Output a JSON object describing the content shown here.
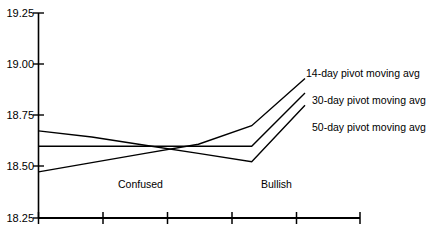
{
  "chart_data": {
    "type": "line",
    "title": "",
    "subtitle": "",
    "xlabel": "",
    "ylabel": "",
    "ylim": [
      18.25,
      19.25
    ],
    "ytick_labels": [
      "19.25",
      "19.00",
      "18.75",
      "18.50",
      "18.25"
    ],
    "ytick_values": [
      19.25,
      19.0,
      18.75,
      18.5,
      18.25
    ],
    "xtick_labels": [
      "",
      "",
      "",
      "",
      "",
      ""
    ],
    "xtick_count": 6,
    "grid": false,
    "legend_position": "right-inline",
    "line_color": "#000000",
    "background_color": "#ffffff",
    "axis_color": "#000000",
    "series": [
      {
        "name": "14-day pivot moving avg",
        "x": [
          0,
          1,
          2,
          3,
          4,
          5
        ],
        "values": [
          18.475,
          18.52,
          18.565,
          18.61,
          18.7,
          18.93
        ]
      },
      {
        "name": "30-day pivot moving avg",
        "x": [
          0,
          1,
          2,
          3,
          4,
          5
        ],
        "values": [
          18.6,
          18.6,
          18.6,
          18.6,
          18.6,
          18.86
        ]
      },
      {
        "name": "50-day pivot moving avg",
        "x": [
          0,
          1,
          2,
          3,
          4,
          5
        ],
        "values": [
          18.675,
          18.645,
          18.605,
          18.565,
          18.525,
          18.8
        ]
      }
    ],
    "annotations": [
      {
        "text": "Confused",
        "x": 1.55,
        "y": 18.4
      },
      {
        "text": "Bullish",
        "x": 3.55,
        "y": 18.4
      }
    ],
    "series_labels": [
      {
        "text": "14-day pivot moving avg",
        "series": "14-day pivot moving avg"
      },
      {
        "text": "30-day pivot moving avg",
        "series": "30-day pivot moving avg"
      },
      {
        "text": "50-day pivot moving avg",
        "series": "50-day pivot moving avg"
      }
    ]
  },
  "axis": {
    "y_labels": {
      "t0": "19.25",
      "t1": "19.00",
      "t2": "18.75",
      "t3": "18.50",
      "t4": "18.25"
    }
  },
  "labels": {
    "series_14": "14-day pivot moving avg",
    "series_30": "30-day pivot moving avg",
    "series_50": "50-day pivot moving avg",
    "annotation_confused": "Confused",
    "annotation_bullish": "Bullish"
  }
}
